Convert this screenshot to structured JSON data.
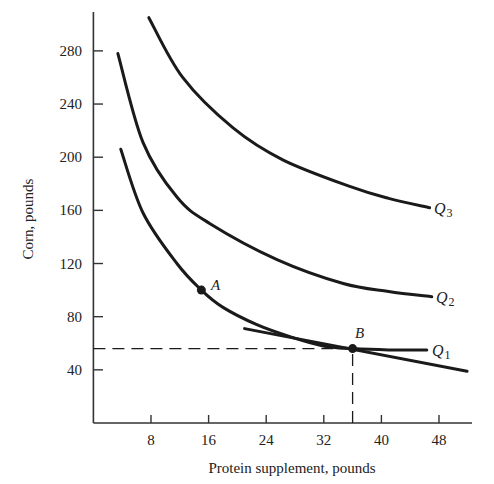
{
  "chart_data": {
    "type": "line",
    "title": "",
    "xlabel": "Protein supplement, pounds",
    "ylabel": "Corn, pounds",
    "xlim": [
      0,
      54
    ],
    "ylim": [
      0,
      305
    ],
    "x_ticks": [
      8,
      16,
      24,
      32,
      40,
      48
    ],
    "y_ticks": [
      40,
      80,
      120,
      160,
      200,
      240,
      280
    ],
    "grid": false,
    "legend": "none (curves labeled inline at right end)",
    "series": [
      {
        "name": "Q1",
        "label_main": "Q",
        "label_sub": "1",
        "kind": "isoquant",
        "points": [
          [
            3.8,
            206
          ],
          [
            6.9,
            158
          ],
          [
            11.6,
            120
          ],
          [
            15,
            100
          ],
          [
            18,
            87
          ],
          [
            22.7,
            74
          ],
          [
            27.3,
            65
          ],
          [
            31.9,
            58
          ],
          [
            36,
            56
          ],
          [
            41,
            55
          ],
          [
            46.3,
            55
          ]
        ]
      },
      {
        "name": "Q2",
        "label_main": "Q",
        "label_sub": "2",
        "kind": "isoquant",
        "points": [
          [
            3.4,
            278
          ],
          [
            6.9,
            211
          ],
          [
            11.6,
            170
          ],
          [
            16.2,
            150
          ],
          [
            25.5,
            123
          ],
          [
            34.7,
            105
          ],
          [
            41,
            99
          ],
          [
            47,
            95
          ]
        ]
      },
      {
        "name": "Q3",
        "label_main": "Q",
        "label_sub": "3",
        "kind": "isoquant",
        "points": [
          [
            7.7,
            305
          ],
          [
            12.4,
            260
          ],
          [
            19.4,
            222
          ],
          [
            26.3,
            198
          ],
          [
            35.6,
            178
          ],
          [
            41,
            169
          ],
          [
            46.7,
            162
          ]
        ]
      },
      {
        "name": "Tangent (isocost) line",
        "kind": "straight-line",
        "points": [
          [
            21,
            71
          ],
          [
            51.9,
            39
          ]
        ]
      }
    ],
    "annotations": [
      {
        "label": "A",
        "x": 15,
        "y": 100,
        "type": "point",
        "on": "Q1"
      },
      {
        "label": "B",
        "x": 36,
        "y": 56,
        "type": "point",
        "on": "Q1",
        "note": "tangency of line with Q1"
      },
      {
        "type": "dashed-guide",
        "from": [
          0,
          56
        ],
        "to": [
          36,
          56
        ]
      },
      {
        "type": "dashed-guide",
        "from": [
          36,
          0
        ],
        "to": [
          36,
          56
        ]
      }
    ]
  },
  "axes": {
    "x_title": "Protein supplement, pounds",
    "y_title": "Corn, pounds",
    "x_tick_labels": [
      "8",
      "16",
      "24",
      "32",
      "40",
      "48"
    ],
    "y_tick_labels": [
      "40",
      "80",
      "120",
      "160",
      "200",
      "240",
      "280"
    ]
  },
  "labels": {
    "point_a": "A",
    "point_b": "B",
    "q1_main": "Q",
    "q1_sub": "1",
    "q2_main": "Q",
    "q2_sub": "2",
    "q3_main": "Q",
    "q3_sub": "3"
  },
  "colors": {
    "ink": "#1a1a1a",
    "axis": "#333333",
    "background": "#ffffff"
  }
}
